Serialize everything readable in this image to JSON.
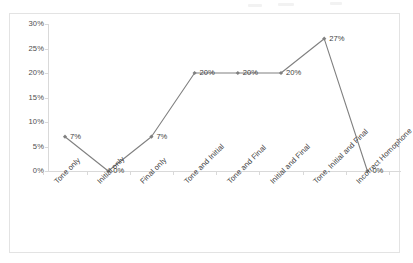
{
  "chart_data": {
    "type": "line",
    "title": "",
    "xlabel": "",
    "ylabel": "",
    "categories": [
      "Tone only",
      "Initial only",
      "Final only",
      "Tone and Initial",
      "Tone and Final",
      "Initial and Final",
      "Tone, Initial and Final",
      "Incorrect Homophone"
    ],
    "values": [
      7,
      0,
      7,
      20,
      20,
      20,
      27,
      0
    ],
    "point_labels": [
      "7%",
      "0%",
      "7%",
      "20%",
      "20%",
      "20%",
      "27%",
      "0%"
    ],
    "ylim": [
      0,
      30
    ],
    "ytick_values": [
      0,
      5,
      10,
      15,
      20,
      25,
      30
    ],
    "ytick_labels": [
      "0%",
      "5%",
      "10%",
      "15%",
      "20%",
      "25%",
      "30%"
    ],
    "grid": false,
    "legend": false,
    "series_color": "#808080",
    "marker": "diamond",
    "axis_color": "#d9d9d9",
    "text_color": "#404040",
    "background": "#ffffff",
    "border_color": "#e3e3e3"
  }
}
